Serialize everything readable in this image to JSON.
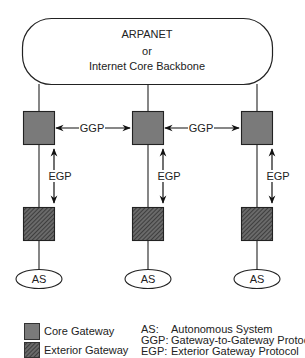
{
  "diagram": {
    "backbone": {
      "line1": "ARPANET",
      "line2": "or",
      "line3": "Internet Core Backbone"
    },
    "columns": [
      {
        "core_x": 23,
        "as_label": "AS",
        "egp_label": "EGP"
      },
      {
        "core_x": 132,
        "as_label": "AS",
        "egp_label": "EGP"
      },
      {
        "core_x": 241,
        "as_label": "AS",
        "egp_label": "EGP"
      }
    ],
    "ggp_links": [
      {
        "label": "GGP"
      },
      {
        "label": "GGP"
      }
    ],
    "colors": {
      "core_gateway": "#7a7a7a",
      "exterior_gateway_bg": "#5a5a5a",
      "exterior_gateway_hatch": "#2a2a2a",
      "stroke": "#222222"
    }
  },
  "legend": {
    "swatches": [
      {
        "label": "Core Gateway"
      },
      {
        "label": "Exterior Gateway"
      }
    ],
    "abbreviations": [
      {
        "abbr": "AS:",
        "definition": "Autonomous System"
      },
      {
        "abbr": "GGP:",
        "definition": "Gateway-to-Gateway Protocol"
      },
      {
        "abbr": "EGP:",
        "definition": "Exterior Gateway Protocol"
      }
    ]
  }
}
